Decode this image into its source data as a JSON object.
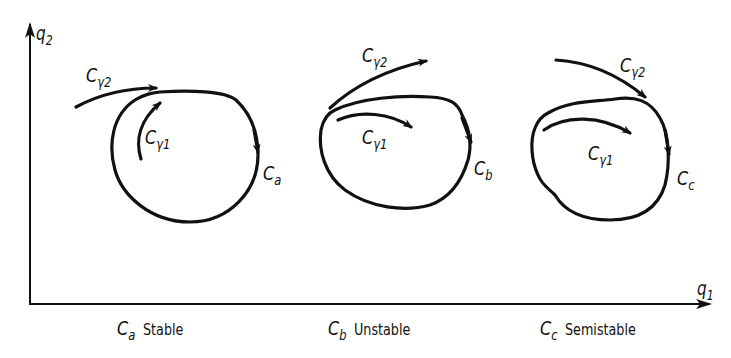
{
  "figure": {
    "axes": {
      "x_label_base": "q",
      "x_label_sub": "1",
      "y_label_base": "q",
      "y_label_sub": "2"
    },
    "panels": [
      {
        "id": "a",
        "curve_label_base": "C",
        "curve_label_sub": "a",
        "gamma1_base": "C",
        "gamma1_sub": "γ1",
        "gamma2_base": "C",
        "gamma2_sub": "γ2",
        "caption_symbol_base": "C",
        "caption_symbol_sub": "a",
        "caption_text": "Stable"
      },
      {
        "id": "b",
        "curve_label_base": "C",
        "curve_label_sub": "b",
        "gamma1_base": "C",
        "gamma1_sub": "γ1",
        "gamma2_base": "C",
        "gamma2_sub": "γ2",
        "caption_symbol_base": "C",
        "caption_symbol_sub": "b",
        "caption_text": "Unstable"
      },
      {
        "id": "c",
        "curve_label_base": "C",
        "curve_label_sub": "c",
        "gamma1_base": "C",
        "gamma1_sub": "γ1",
        "gamma2_base": "C",
        "gamma2_sub": "γ2",
        "caption_symbol_base": "C",
        "caption_symbol_sub": "c",
        "caption_text": "Semistable"
      }
    ],
    "colors": {
      "ink": "#111111",
      "background": "#ffffff"
    }
  }
}
